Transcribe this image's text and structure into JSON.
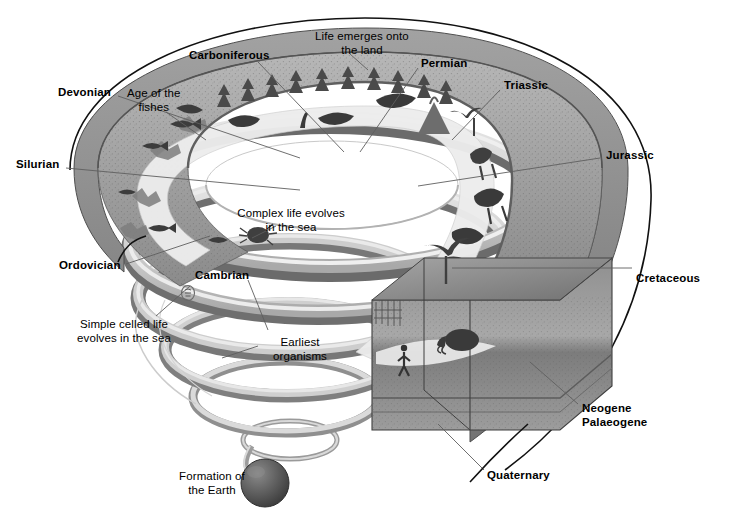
{
  "diagram": {
    "type": "spiral-timeline",
    "background_color": "#ffffff",
    "ink_color": "#000000"
  },
  "palette": {
    "band_light": "#dcdcdc",
    "band_mid": "#b4b4b4",
    "band_dark": "#8a8a8a",
    "band_edge": "#6e6e6e",
    "terrain_rock": "#9a9a9a",
    "terrain_dark": "#6f6f6f",
    "water": "#ededed",
    "earth_sphere": "#5d5d5d",
    "leader_line": "#6b6b6b",
    "outline": "#111111"
  },
  "period_labels": [
    {
      "id": "silurian",
      "text": "Silurian",
      "x": 16,
      "y": 158,
      "bold": true,
      "align": "left"
    },
    {
      "id": "devonian",
      "text": "Devonian",
      "x": 58,
      "y": 86,
      "bold": true,
      "align": "left"
    },
    {
      "id": "carboniferous",
      "text": "Carboniferous",
      "x": 189,
      "y": 49,
      "bold": true,
      "align": "left"
    },
    {
      "id": "permian",
      "text": "Permian",
      "x": 421,
      "y": 57,
      "bold": true,
      "align": "left"
    },
    {
      "id": "triassic",
      "text": "Triassic",
      "x": 504,
      "y": 79,
      "bold": true,
      "align": "left"
    },
    {
      "id": "jurassic",
      "text": "Jurassic",
      "x": 606,
      "y": 149,
      "bold": true,
      "align": "left"
    },
    {
      "id": "cretaceous",
      "text": "Cretaceous",
      "x": 636,
      "y": 272,
      "bold": true,
      "align": "left"
    },
    {
      "id": "neogene",
      "text": "Neogene\nPalaeogene",
      "x": 582,
      "y": 402,
      "bold": true,
      "align": "left"
    },
    {
      "id": "quaternary",
      "text": "Quaternary",
      "x": 487,
      "y": 469,
      "bold": true,
      "align": "left"
    },
    {
      "id": "ordovician",
      "text": "Ordovician",
      "x": 59,
      "y": 259,
      "bold": true,
      "align": "left"
    },
    {
      "id": "cambrian",
      "text": "Cambrian",
      "x": 195,
      "y": 269,
      "bold": true,
      "align": "left"
    }
  ],
  "event_labels": [
    {
      "id": "age-of-fishes",
      "text": "Age of the\nfishes",
      "x": 127,
      "y": 87,
      "align": "left"
    },
    {
      "id": "life-emerges",
      "text": "Life emerges onto\nthe land",
      "x": 306,
      "y": 30,
      "align": "center"
    },
    {
      "id": "complex-life",
      "text": "Complex life evolves\nin the sea",
      "x": 223,
      "y": 207,
      "align": "left"
    },
    {
      "id": "simple-celled-life",
      "text": "Simple celled life\nevolves in the sea",
      "x": 66,
      "y": 318,
      "align": "left"
    },
    {
      "id": "earliest-organisms",
      "text": "Earliest\norganisms",
      "x": 261,
      "y": 336,
      "align": "left"
    },
    {
      "id": "formation-earth",
      "text": "Formation of\nthe Earth",
      "x": 171,
      "y": 470,
      "align": "left"
    }
  ]
}
